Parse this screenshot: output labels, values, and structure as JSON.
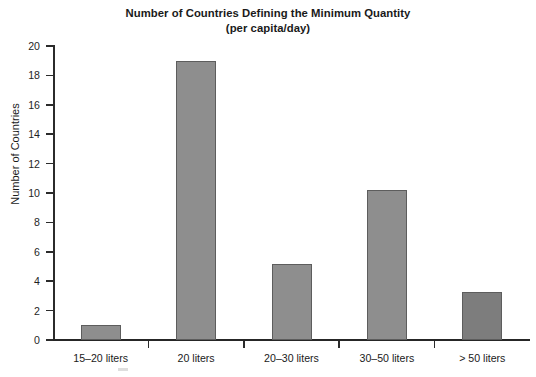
{
  "chart_data": {
    "type": "bar",
    "title": "Number of Countries Defining the Minimum Quantity",
    "subtitle": "(per capita/day)",
    "xlabel": "",
    "ylabel": "Number of Countries",
    "categories": [
      "15–20 liters",
      "20 liters",
      "20–30 liters",
      "30–50 liters",
      "> 50 liters"
    ],
    "values": [
      1.0,
      19.0,
      5.2,
      10.2,
      3.3
    ],
    "ylim": [
      0,
      20
    ],
    "yticks": [
      0,
      2,
      4,
      6,
      8,
      10,
      12,
      14,
      16,
      18,
      20
    ],
    "ytick_labels": [
      "0",
      "2",
      "4",
      "6",
      "8",
      "10",
      "12",
      "14",
      "16",
      "18",
      "20"
    ],
    "grid": false,
    "legend": "none",
    "bar_colors": [
      "#8e8e8e",
      "#8e8e8e",
      "#8e8e8e",
      "#8e8e8e",
      "#7d7d7d"
    ],
    "bar_edge_color": "#5d5d5d",
    "axis_color": "#2b2b2b",
    "background": "#ffffff"
  }
}
